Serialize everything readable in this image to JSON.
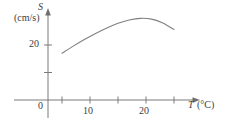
{
  "chart_data": {
    "type": "line",
    "title": "",
    "subtitle": "",
    "xlabel": "T",
    "xlabel_unit": "(°C)",
    "ylabel": "S",
    "ylabel_unit": "(cm/s)",
    "xlim": [
      0,
      28
    ],
    "ylim": [
      0,
      40
    ],
    "grid": false,
    "legend": null,
    "x_ticks": [
      5,
      10,
      15,
      20,
      25
    ],
    "x_tick_labels": [
      "",
      "10",
      "",
      "20",
      ""
    ],
    "y_ticks": [
      10,
      20
    ],
    "y_tick_labels": [
      "",
      "20"
    ],
    "origin_label": "0",
    "axis_arrows": [
      "x",
      "y"
    ],
    "series": [
      {
        "name": "S(T)",
        "color": "#808080",
        "x": [
          5,
          7,
          9,
          11,
          13,
          15,
          17,
          19,
          21,
          23,
          25
        ],
        "y": [
          17.0,
          19.6,
          22.0,
          24.2,
          26.2,
          27.9,
          29.1,
          29.7,
          29.4,
          28.0,
          25.6
        ]
      }
    ],
    "annotations": []
  },
  "figure": {
    "background": "#ffffff",
    "axis_color": "#7a7a7a",
    "curve_color": "#808080",
    "text_color": "#3d3d3d"
  }
}
